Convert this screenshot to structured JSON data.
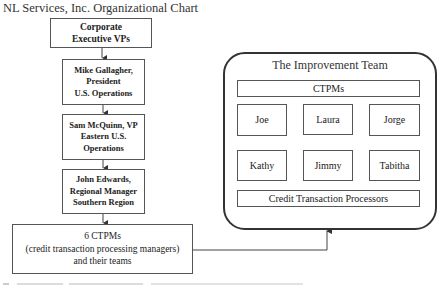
{
  "chart_title": "NL Services, Inc. Organizational Chart",
  "hierarchy": [
    {
      "id": "corporate",
      "lines": [
        "Corporate",
        "Executive VPs"
      ]
    },
    {
      "id": "mike",
      "lines": [
        "Mike Gallagher,",
        "President",
        "U.S. Operations"
      ]
    },
    {
      "id": "sam",
      "lines": [
        "Sam McQuinn, VP",
        "Eastern U.S.",
        "Operations"
      ]
    },
    {
      "id": "john",
      "lines": [
        "John Edwards,",
        "Regional Manager",
        "Southern Region"
      ]
    },
    {
      "id": "ctpms",
      "lines": [
        "6 CTPMs",
        "(credit transaction processing managers)",
        "and their teams"
      ]
    }
  ],
  "improvement_team": {
    "title": "The Improvement Team",
    "top_bar": "CTPMs",
    "managers": [
      "Joe",
      "Laura",
      "Jorge"
    ],
    "processors": [
      "Kathy",
      "Jimmy",
      "Tabitha"
    ],
    "bottom_bar": "Credit Transaction Processors"
  },
  "colors": {
    "line": "#444444",
    "border": "#555555",
    "text": "#222222"
  }
}
